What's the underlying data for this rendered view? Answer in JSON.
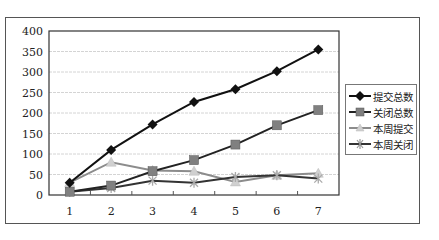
{
  "chart_data": {
    "type": "line",
    "title": "",
    "xlabel": "",
    "ylabel": "",
    "categories": [
      "1",
      "2",
      "3",
      "4",
      "5",
      "6",
      "7"
    ],
    "ylim": [
      0,
      400
    ],
    "yticks": [
      "0",
      "50",
      "100",
      "150",
      "200",
      "250",
      "300",
      "350",
      "400"
    ],
    "grid": true,
    "legend_position": "right",
    "series": [
      {
        "name": "提交总数",
        "color": "#111111",
        "marker": "diamond",
        "values": [
          30,
          110,
          172,
          227,
          258,
          302,
          355
        ]
      },
      {
        "name": "关闭总数",
        "color": "#222222",
        "marker": "square",
        "marker_color": "#808080",
        "values": [
          8,
          23,
          58,
          85,
          123,
          170,
          207
        ]
      },
      {
        "name": "本周提交",
        "color": "#8c8c8c",
        "marker": "triangle",
        "marker_color": "#d0d0d0",
        "values": [
          30,
          80,
          60,
          58,
          32,
          48,
          53
        ]
      },
      {
        "name": "本周关闭",
        "color": "#333333",
        "marker": "star",
        "marker_color": "#aaaaaa",
        "values": [
          8,
          17,
          35,
          30,
          44,
          48,
          40
        ]
      }
    ]
  },
  "legend": {
    "items": [
      {
        "label": "提交总数"
      },
      {
        "label": "关闭总数"
      },
      {
        "label": "本周提交"
      },
      {
        "label": "本周关闭"
      }
    ]
  }
}
